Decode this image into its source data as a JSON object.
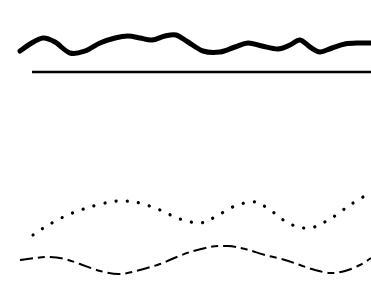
{
  "background": "#ffffff",
  "stroke_color": "#000000",
  "lines": [
    {
      "name": "thick-wavy-line",
      "style": "thick-irregular",
      "points": [
        [
          20,
          51
        ],
        [
          30,
          44
        ],
        [
          43,
          38
        ],
        [
          55,
          42
        ],
        [
          70,
          53
        ],
        [
          85,
          51
        ],
        [
          100,
          43
        ],
        [
          115,
          38
        ],
        [
          128,
          36
        ],
        [
          140,
          38
        ],
        [
          152,
          40
        ],
        [
          165,
          36
        ],
        [
          176,
          35
        ],
        [
          188,
          42
        ],
        [
          203,
          51
        ],
        [
          220,
          52
        ],
        [
          235,
          47
        ],
        [
          248,
          43
        ],
        [
          262,
          46
        ],
        [
          278,
          49
        ],
        [
          290,
          45
        ],
        [
          300,
          40
        ],
        [
          310,
          47
        ],
        [
          320,
          52
        ],
        [
          332,
          48
        ],
        [
          345,
          44
        ],
        [
          360,
          43
        ],
        [
          371,
          43
        ]
      ]
    },
    {
      "name": "straight-line",
      "style": "solid",
      "points": [
        [
          32,
          72
        ],
        [
          371,
          72
        ]
      ]
    },
    {
      "name": "dotted-wavy-line",
      "style": "dotted",
      "points": [
        [
          33,
          235
        ],
        [
          50,
          224
        ],
        [
          70,
          214
        ],
        [
          90,
          207
        ],
        [
          110,
          202
        ],
        [
          125,
          201
        ],
        [
          140,
          203
        ],
        [
          160,
          210
        ],
        [
          180,
          219
        ],
        [
          200,
          223
        ],
        [
          215,
          217
        ],
        [
          235,
          206
        ],
        [
          255,
          202
        ],
        [
          270,
          210
        ],
        [
          290,
          224
        ],
        [
          310,
          228
        ],
        [
          330,
          219
        ],
        [
          350,
          205
        ],
        [
          368,
          194
        ]
      ]
    },
    {
      "name": "dashed-wavy-line",
      "style": "dashed",
      "points": [
        [
          20,
          260
        ],
        [
          35,
          258
        ],
        [
          50,
          257
        ],
        [
          65,
          259
        ],
        [
          80,
          264
        ],
        [
          100,
          271
        ],
        [
          120,
          274
        ],
        [
          140,
          270
        ],
        [
          160,
          264
        ],
        [
          172,
          259
        ],
        [
          190,
          252
        ],
        [
          210,
          247
        ],
        [
          228,
          246
        ],
        [
          245,
          249
        ],
        [
          265,
          255
        ],
        [
          285,
          260
        ],
        [
          300,
          265
        ],
        [
          315,
          270
        ],
        [
          330,
          273
        ],
        [
          345,
          271
        ],
        [
          360,
          265
        ],
        [
          371,
          258
        ]
      ]
    }
  ]
}
